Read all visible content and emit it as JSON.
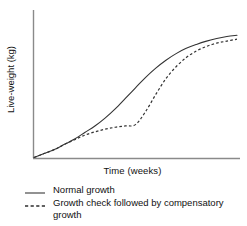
{
  "chart_data": {
    "type": "line",
    "title": "",
    "xlabel": "Time (weeks)",
    "ylabel": "Live-weight (kg)",
    "grid": false,
    "axis_ticks": false,
    "legend_position": "below-plot-left",
    "xlim": [
      0,
      100
    ],
    "ylim": [
      0,
      100
    ],
    "series": [
      {
        "name": "Normal growth",
        "style": "solid",
        "color": "#333333",
        "x": [
          0,
          5,
          10,
          15,
          20,
          25,
          30,
          35,
          40,
          45,
          50,
          55,
          60,
          65,
          70,
          75,
          80,
          85,
          90,
          95,
          100
        ],
        "y": [
          0,
          3,
          6,
          10,
          14,
          19,
          24,
          30,
          37,
          45,
          53,
          61,
          68,
          74,
          79,
          83,
          86,
          88.5,
          90.5,
          92,
          93
        ]
      },
      {
        "name": "Growth check followed by compensatory growth",
        "style": "dashed",
        "color": "#333333",
        "x": [
          0,
          5,
          10,
          15,
          20,
          25,
          30,
          35,
          40,
          45,
          50,
          55,
          60,
          65,
          70,
          75,
          80,
          85,
          90,
          95,
          100
        ],
        "y": [
          0,
          3,
          6,
          10,
          13.5,
          17,
          19.5,
          21.5,
          23,
          24,
          25,
          35,
          48,
          60,
          69,
          76,
          81,
          84.5,
          87,
          88.5,
          90
        ]
      }
    ],
    "annotations": []
  },
  "legend": {
    "items": [
      {
        "label": "Normal growth",
        "style": "solid"
      },
      {
        "label": "Growth check followed by compensatory growth",
        "style": "dashed"
      }
    ]
  },
  "axes": {
    "x_title": "Time (weeks)",
    "y_title": "Live-weight (kg)"
  },
  "colors": {
    "axis": "#888888",
    "line": "#333333",
    "text": "#111111",
    "background": "#ffffff"
  }
}
